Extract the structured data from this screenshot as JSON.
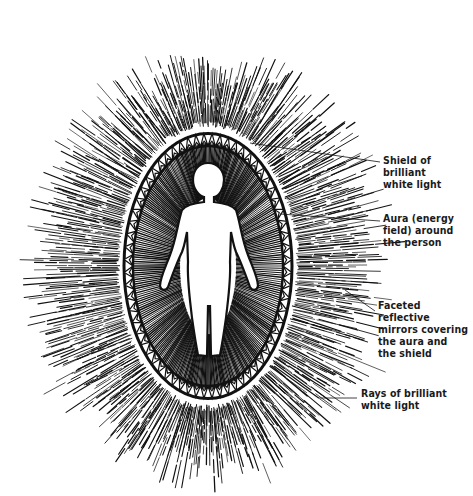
{
  "diagram": {
    "colors": {
      "ink": "#111111",
      "paper": "#ffffff"
    },
    "figure": {
      "center_x": 208,
      "center_y": 266,
      "aura_rx": 75,
      "aura_ry": 125,
      "outer_rx": 200,
      "outer_ry": 235
    },
    "labels": [
      {
        "id": "shield",
        "text": "Shield of\nbrilliant\nwhite light",
        "x": 383,
        "y": 154,
        "leader": [
          250,
          143,
          380,
          162
        ]
      },
      {
        "id": "aura",
        "text": "Aura (energy\nfield) around\nthe person",
        "x": 383,
        "y": 212,
        "leader": [
          280,
          214,
          380,
          221
        ]
      },
      {
        "id": "mirrors",
        "text": "Faceted reflective\nmirrors covering\nthe aura and\nthe shield",
        "x": 378,
        "y": 299,
        "leader": [
          345,
          290,
          375,
          311
        ]
      },
      {
        "id": "rays",
        "text": "Rays of brilliant\nwhite light",
        "x": 361,
        "y": 387,
        "leader": [
          318,
          398,
          357,
          398
        ]
      }
    ]
  }
}
